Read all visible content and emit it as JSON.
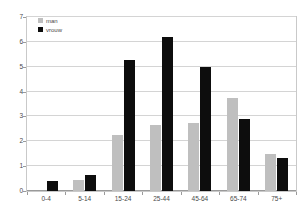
{
  "chart_data": {
    "type": "bar",
    "title": "",
    "subtitle": "",
    "xlabel": "",
    "ylabel": "",
    "ylim": [
      0,
      7
    ],
    "yticks": [
      0,
      1,
      2,
      3,
      4,
      5,
      6,
      7
    ],
    "ytick_labels": [
      "0",
      "1",
      "2",
      "3",
      "4",
      "5",
      "6",
      "7"
    ],
    "grid": true,
    "legend_position": "top-left",
    "categories": [
      "0-4",
      "5-14",
      "15-24",
      "25-44",
      "45-64",
      "65-74",
      "75+"
    ],
    "series": [
      {
        "name": "man",
        "color": "#bfbfbf",
        "values": [
          0,
          0.45,
          2.25,
          2.65,
          2.75,
          3.75,
          1.48
        ]
      },
      {
        "name": "vrouw",
        "color": "#0d0d0d",
        "values": [
          0.42,
          0.65,
          5.28,
          6.2,
          5.0,
          2.9,
          1.32
        ]
      }
    ]
  },
  "legend": {
    "items": [
      {
        "label": "man",
        "swatch": "man"
      },
      {
        "label": "vrouw",
        "swatch": "vrouw"
      }
    ]
  },
  "colors": {
    "series_man": "#bfbfbf",
    "series_vrouw": "#0d0d0d",
    "gridline": "#d4d4d4",
    "axis": "#9a9a9a",
    "plot_border": "#c9c9c9",
    "text": "#4a4a4a",
    "background": "#ffffff"
  }
}
